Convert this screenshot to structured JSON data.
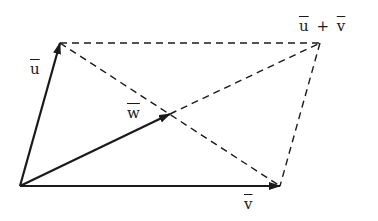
{
  "diagram": {
    "type": "vector-parallelogram",
    "colors": {
      "stroke": "#1a1a1a",
      "background": "#ffffff"
    },
    "points": {
      "origin": [
        20,
        186
      ],
      "u_tip": [
        60,
        43
      ],
      "v_tip": [
        280,
        186
      ],
      "sum_tip": [
        320,
        43
      ],
      "w_tip": [
        170,
        114
      ]
    },
    "labels": {
      "u": "u",
      "v": "v",
      "w": "w",
      "sum_u": "u",
      "sum_plus": "+",
      "sum_v": "v"
    }
  }
}
